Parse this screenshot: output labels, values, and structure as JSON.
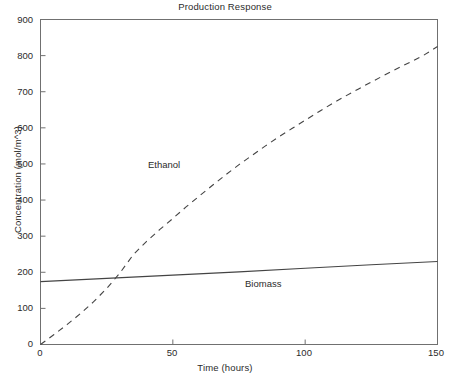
{
  "chart_data": {
    "type": "line",
    "title": "Production Response",
    "xlabel": "Time (hours)",
    "ylabel": "Concentration (mol/m^3)",
    "xlim": [
      0,
      150
    ],
    "ylim": [
      0,
      900
    ],
    "xticks": [
      0,
      50,
      100,
      150
    ],
    "yticks": [
      0,
      100,
      200,
      300,
      400,
      500,
      600,
      700,
      800,
      900
    ],
    "xtick_labels": [
      "0",
      "50",
      "100",
      "150"
    ],
    "ytick_labels": [
      "0",
      "100",
      "200",
      "300",
      "400",
      "500",
      "600",
      "700",
      "800",
      "900"
    ],
    "grid": false,
    "legend_position": "inline-annotations",
    "frame": "box",
    "series": [
      {
        "name": "Ethanol",
        "style": "dashed",
        "color": "#444444",
        "annotation": "Ethanol",
        "annotation_x": 33,
        "annotation_y": 460,
        "x": [
          0,
          5,
          10,
          15,
          20,
          25,
          30,
          35,
          40,
          45,
          50,
          55,
          60,
          65,
          70,
          75,
          80,
          85,
          90,
          95,
          100,
          105,
          110,
          115,
          120,
          125,
          130,
          135,
          140,
          145,
          150
        ],
        "y": [
          0,
          27,
          55,
          85,
          118,
          155,
          198,
          248,
          285,
          318,
          349,
          381,
          411,
          441,
          470,
          498,
          524,
          550,
          575,
          598,
          621,
          644,
          666,
          687,
          707,
          727,
          746,
          765,
          783,
          802,
          825
        ]
      },
      {
        "name": "Biomass",
        "style": "solid",
        "color": "#444444",
        "annotation": "Biomass",
        "annotation_x": 91,
        "annotation_y": 150,
        "x": [
          0,
          25,
          50,
          75,
          100,
          125,
          150
        ],
        "y": [
          174,
          183,
          192,
          201,
          211,
          221,
          230
        ]
      }
    ],
    "crossing_point": {
      "x": 27,
      "y": 185
    }
  }
}
